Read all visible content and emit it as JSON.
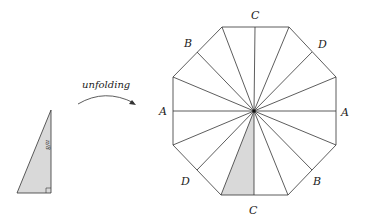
{
  "caption": "unfolding",
  "triangle": {
    "angle_label": "π/8",
    "fill": "#d9d9d9"
  },
  "octagon": {
    "labels": {
      "top": "C",
      "top_left": "B",
      "top_right": "D",
      "left": "A",
      "right": "A",
      "bottom_left": "D",
      "bottom_right": "B",
      "bottom": "C"
    },
    "shaded_fill": "#d9d9d9",
    "stroke": "#333333"
  }
}
